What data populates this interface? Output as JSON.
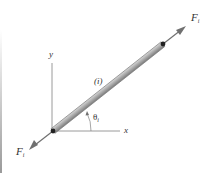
{
  "diagram": {
    "type": "truss member free-body diagram",
    "member_label": "(i)",
    "angle_label": "θ",
    "angle_subscript": "i",
    "force_top": {
      "label": "F",
      "subscript": "i"
    },
    "force_bottom": {
      "label": "F",
      "subscript": "i"
    },
    "axis_x_label": "x",
    "axis_y_label": "y",
    "colors": {
      "member_fill": "#b5b5b5",
      "member_edge": "#6e6e6e",
      "arrow": "#707070",
      "axis": "#808080",
      "joint": "#222222",
      "text": "#333333"
    }
  }
}
